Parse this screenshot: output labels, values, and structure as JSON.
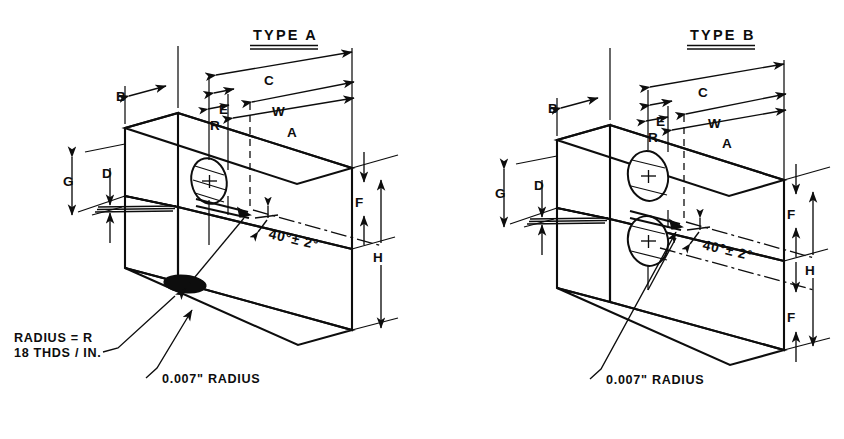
{
  "sheet": {
    "background_color": "#ffffff",
    "ink_color": "#0d0d0d",
    "description": "Isometric engineering detail drawing of two notched specimen block types"
  },
  "views": [
    {
      "id": "type-a",
      "title": "TYPE A",
      "dimensions": {
        "b": "B",
        "c": "C",
        "e": "E",
        "r": "R",
        "w": "W",
        "a": "A",
        "g": "G",
        "d": "D",
        "f": "F",
        "h": "H"
      },
      "angle_note": "40°± 2°",
      "notes": [
        "RADIUS = R",
        "18 THDS / IN.",
        "0.007\" RADIUS"
      ],
      "features": {
        "threaded_hole_count": 1,
        "bottom_hole": "filled-ellipse"
      }
    },
    {
      "id": "type-b",
      "title": "TYPE B",
      "dimensions": {
        "b": "B",
        "c": "C",
        "e": "E",
        "r": "R",
        "w": "W",
        "a": "A",
        "g": "G",
        "d": "D",
        "f_upper": "F",
        "h": "H",
        "f_lower": "F"
      },
      "angle_note": "40°± 2°",
      "notes": [
        "0.007\" RADIUS"
      ],
      "features": {
        "hole_count": 2
      }
    }
  ]
}
